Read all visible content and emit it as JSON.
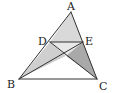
{
  "diagram": {
    "type": "geometry-triangle",
    "points": {
      "A": {
        "x": 71,
        "y": 12
      },
      "D": {
        "x": 50,
        "y": 42
      },
      "E": {
        "x": 83,
        "y": 42
      },
      "B": {
        "x": 19,
        "y": 79
      },
      "C": {
        "x": 97,
        "y": 79
      },
      "O": {
        "x": 66,
        "y": 56
      }
    },
    "labels": {
      "A": "A",
      "D": "D",
      "E": "E",
      "B": "B",
      "C": "C"
    },
    "segments": [
      "AB",
      "AC",
      "BC",
      "DE",
      "BE",
      "DC"
    ],
    "colors": {
      "stroke": "#333333",
      "region_ADE": "#d9d9d9",
      "region_DOE": "#e8e8e8",
      "region_DBO": "#cfcfcf",
      "region_EOC": "#a9a9a9",
      "region_BOC": "#ffffff"
    }
  }
}
